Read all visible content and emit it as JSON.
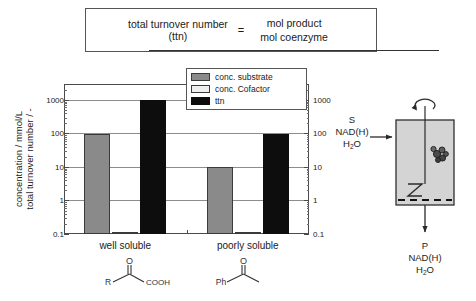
{
  "formula": {
    "lhs_line1": "total turnover number",
    "lhs_line2": "(ttn)",
    "equals": "=",
    "numerator": "mol product",
    "denominator": "mol coenzyme"
  },
  "chart_axis": {
    "label_line1": "concentration / mmol/L",
    "label_line2": "total turnover number / -"
  },
  "legend": {
    "items": [
      {
        "label": "conc. substrate",
        "color": "#8a8a8a",
        "key": "substrate"
      },
      {
        "label": "conc. Cofactor",
        "color": "#efefef",
        "key": "cofactor"
      },
      {
        "label": "ttn",
        "color": "#0d0d0d",
        "key": "ttn"
      }
    ]
  },
  "structures": {
    "well_soluble": {
      "left_label": "R",
      "right_label": "COOH",
      "carbonyl": "O"
    },
    "poorly_soluble": {
      "left_label": "Ph",
      "carbonyl": "O"
    }
  },
  "reactor": {
    "inlet_line1": "S",
    "inlet_line2": "NAD(H)",
    "inlet_line3_main": "H",
    "inlet_line3_sub": "2",
    "inlet_line3_tail": "O",
    "outlet_line1": "P",
    "outlet_line2": "NAD(H)",
    "outlet_line3_main": "H",
    "outlet_line3_sub": "2",
    "outlet_line3_tail": "O"
  },
  "caption_fragment": "",
  "chart_data": {
    "type": "bar",
    "title": "",
    "xlabel": "",
    "ylabel": "concentration / mmol/L    total turnover number / -",
    "yscale": "log",
    "ylim": [
      0.1,
      3000
    ],
    "y_ticks": [
      0.1,
      1,
      10,
      100,
      1000
    ],
    "y_tick_labels": [
      "0.1",
      "1",
      "10",
      "100",
      "1000"
    ],
    "right_axis_mirrors_left": true,
    "grid": true,
    "legend_position": "top-right-inside",
    "categories": [
      "well soluble",
      "poorly soluble"
    ],
    "series": [
      {
        "name": "conc. substrate",
        "values": [
          100,
          10
        ],
        "color": "#8a8a8a"
      },
      {
        "name": "conc. Cofactor",
        "values": [
          0.1,
          0.1
        ],
        "color": "#efefef"
      },
      {
        "name": "ttn",
        "values": [
          1000,
          100
        ],
        "color": "#0d0d0d"
      }
    ]
  }
}
